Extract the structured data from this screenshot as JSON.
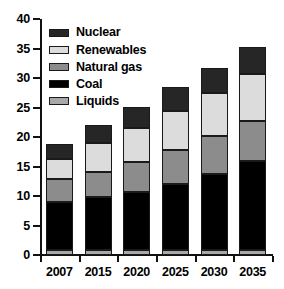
{
  "chart_data": {
    "type": "bar",
    "stacked": true,
    "title": "",
    "subtitle": "",
    "xlabel": "",
    "ylabel": "",
    "categories": [
      "2007",
      "2015",
      "2020",
      "2025",
      "2030",
      "2035"
    ],
    "ylim": [
      0,
      40
    ],
    "yticks": [
      0,
      5,
      10,
      15,
      20,
      25,
      30,
      35,
      40
    ],
    "ytick_labels": [
      "0",
      "5",
      "10",
      "15",
      "20",
      "25",
      "30",
      "35",
      "40"
    ],
    "grid": false,
    "legend_position": "top-left",
    "series": [
      {
        "name": "Liquids",
        "color": "#a8a8a8",
        "values": [
          0.8,
          0.8,
          0.8,
          0.8,
          0.8,
          0.8
        ]
      },
      {
        "name": "Coal",
        "color": "#000000",
        "values": [
          8.2,
          9.0,
          9.9,
          11.2,
          13.0,
          15.2
        ]
      },
      {
        "name": "Natural gas",
        "color": "#8c8c8c",
        "values": [
          3.9,
          4.2,
          5.0,
          5.8,
          6.4,
          6.7
        ]
      },
      {
        "name": "Renewables",
        "color": "#dcdcdc",
        "values": [
          3.3,
          4.9,
          5.8,
          6.6,
          7.3,
          8.0
        ]
      },
      {
        "name": "Nuclear",
        "color": "#262626",
        "values": [
          2.6,
          3.1,
          3.6,
          4.0,
          4.2,
          4.5
        ]
      }
    ],
    "cumulative_tops": {
      "Liquids": [
        0.8,
        0.8,
        0.8,
        0.8,
        0.8,
        0.8
      ],
      "Coal": [
        9.0,
        9.8,
        10.7,
        12.0,
        13.8,
        16.0
      ],
      "Natural gas": [
        12.9,
        14.0,
        15.7,
        17.8,
        20.2,
        22.7
      ],
      "Renewables": [
        16.2,
        18.9,
        21.5,
        24.4,
        27.5,
        30.7
      ],
      "Nuclear": [
        18.8,
        22.0,
        25.1,
        28.4,
        31.7,
        35.2
      ]
    },
    "totals": [
      18.8,
      22.0,
      25.1,
      28.4,
      31.7,
      35.2
    ]
  },
  "legend": {
    "items": [
      {
        "label": "Nuclear",
        "color": "#262626"
      },
      {
        "label": "Renewables",
        "color": "#dcdcdc"
      },
      {
        "label": "Natural gas",
        "color": "#8c8c8c"
      },
      {
        "label": "Coal",
        "color": "#000000"
      },
      {
        "label": "Liquids",
        "color": "#a8a8a8"
      }
    ]
  },
  "axes": {
    "y_labels": [
      "40",
      "35",
      "30",
      "25",
      "20",
      "15",
      "10",
      "5",
      "0"
    ],
    "x_labels": [
      "2007",
      "2015",
      "2020",
      "2025",
      "2030",
      "2035"
    ]
  }
}
